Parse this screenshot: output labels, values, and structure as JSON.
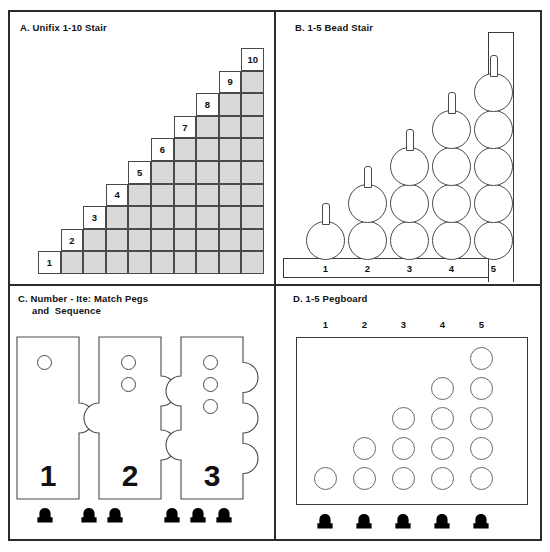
{
  "figure": {
    "panels": [
      {
        "id": "A",
        "title": "A. Unifix 1-10 Stair",
        "labels": [
          "1",
          "2",
          "3",
          "4",
          "5",
          "6",
          "7",
          "8",
          "9",
          "10"
        ],
        "max": 10
      },
      {
        "id": "B",
        "title": "B. 1-5 Bead Stair",
        "labels": [
          "1",
          "2",
          "3",
          "4",
          "5"
        ],
        "max": 5
      },
      {
        "id": "C",
        "title": "C. Number - Ite: Match Pegs\n     and  Sequence",
        "cards": [
          {
            "label": "1",
            "holes": 1,
            "notches": 0,
            "bumps": 1
          },
          {
            "label": "2",
            "holes": 2,
            "notches": 1,
            "bumps": 2
          },
          {
            "label": "3",
            "holes": 3,
            "notches": 2,
            "bumps": 3
          }
        ],
        "peg_groups": [
          1,
          2,
          3
        ]
      },
      {
        "id": "D",
        "title": "D. 1-5 Pegboard",
        "labels": [
          "1",
          "2",
          "3",
          "4",
          "5"
        ],
        "columns": [
          1,
          2,
          3,
          4,
          5
        ],
        "pegs": 5
      }
    ]
  },
  "colors": {
    "ink": "#2b2b2b",
    "cell_fill": "#d9d9d9",
    "cell_stroke": "#4a4a4a",
    "peg_fill": "#000000",
    "paper": "#ffffff"
  }
}
